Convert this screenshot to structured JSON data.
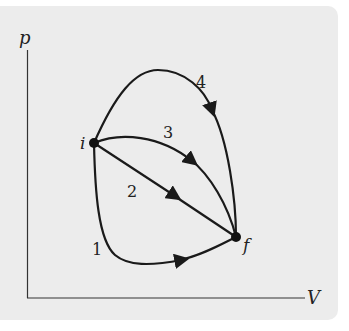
{
  "figure": {
    "background_color": "#ececec",
    "line_color": "#1a1a1a",
    "axes": {
      "x_label": "V",
      "y_label": "p"
    },
    "points": [
      {
        "id": "i",
        "label": "i"
      },
      {
        "id": "f",
        "label": "f"
      }
    ],
    "paths": [
      {
        "id": "1",
        "label": "1",
        "from": "i",
        "to": "f"
      },
      {
        "id": "2",
        "label": "2",
        "from": "i",
        "to": "f"
      },
      {
        "id": "3",
        "label": "3",
        "from": "i",
        "to": "f"
      },
      {
        "id": "4",
        "label": "4",
        "from": "i",
        "to": "f"
      }
    ]
  }
}
